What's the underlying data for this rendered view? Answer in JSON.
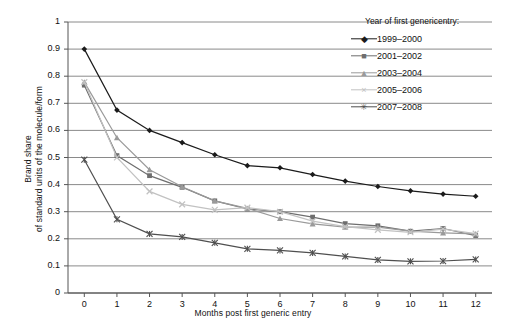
{
  "chart_data": {
    "type": "line",
    "title": "",
    "xlabel": "Months post first generic entry",
    "ylabel": "Brand share of standard units of the molecule/form",
    "ylabel_line1": "Brand share",
    "ylabel_line2": "of standard units of the molecule/form",
    "x": [
      0,
      1,
      2,
      3,
      4,
      5,
      6,
      7,
      8,
      9,
      10,
      11,
      12
    ],
    "xticklabels": [
      "0",
      "1",
      "2",
      "3",
      "4",
      "5",
      "6",
      "7",
      "8",
      "9",
      "10",
      "11",
      "12"
    ],
    "yticklabels": [
      "0",
      "0.1",
      "0.2",
      "0.3",
      "0.4",
      "0.5",
      "0.6",
      "0.7",
      "0.8",
      "0.9",
      "1"
    ],
    "ylim": [
      0,
      1
    ],
    "xlim": [
      -0.5,
      12.5
    ],
    "grid": "horizontal",
    "legend_position": "top-right",
    "legend_title": "Year of first genericentry:",
    "series": [
      {
        "name": "1999–2000",
        "marker": "diamond",
        "color": "#1b1b1b",
        "values": [
          0.9,
          0.675,
          0.6,
          0.555,
          0.51,
          0.47,
          0.462,
          0.437,
          0.413,
          0.393,
          0.377,
          0.365,
          0.357
        ]
      },
      {
        "name": "2001–2002",
        "marker": "square",
        "color": "#6e6e6e",
        "values": [
          0.767,
          0.507,
          0.433,
          0.39,
          0.34,
          0.31,
          0.3,
          0.28,
          0.256,
          0.248,
          0.228,
          0.238,
          0.212
        ]
      },
      {
        "name": "2003–2004",
        "marker": "triangle",
        "color": "#9a9a9a",
        "values": [
          0.778,
          0.573,
          0.455,
          0.392,
          0.34,
          0.312,
          0.275,
          0.255,
          0.243,
          0.243,
          0.228,
          0.222,
          0.218
        ]
      },
      {
        "name": "2005–2006",
        "marker": "cross",
        "color": "#c2c2c2",
        "values": [
          0.778,
          0.5,
          0.375,
          0.327,
          0.307,
          0.315,
          0.3,
          0.265,
          0.245,
          0.233,
          0.224,
          0.236,
          0.219
        ]
      },
      {
        "name": "2007–2008",
        "marker": "asterisk",
        "color": "#4f4f4f",
        "values": [
          0.492,
          0.272,
          0.218,
          0.207,
          0.185,
          0.163,
          0.157,
          0.148,
          0.135,
          0.122,
          0.117,
          0.118,
          0.124
        ]
      }
    ]
  }
}
